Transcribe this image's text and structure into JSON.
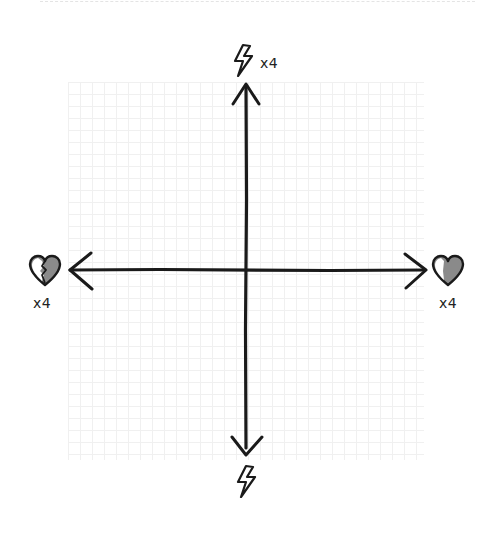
{
  "diagram": {
    "type": "four-direction axis diagram",
    "axes": {
      "top": {
        "icon": "lightning-bolt-icon",
        "multiplier": "x4"
      },
      "bottom": {
        "icon": "lightning-bolt-icon",
        "multiplier": ""
      },
      "left": {
        "icon": "broken-heart-icon",
        "multiplier": "x4"
      },
      "right": {
        "icon": "half-filled-heart-icon",
        "multiplier": "x4"
      }
    },
    "colors": {
      "stroke": "#1a1a1a",
      "fill": "#8a8a8a",
      "grid": "#f0f0f0",
      "background": "#ffffff"
    }
  },
  "labels": {
    "top_multiplier": "x4",
    "left_multiplier": "x4",
    "right_multiplier": "x4"
  }
}
